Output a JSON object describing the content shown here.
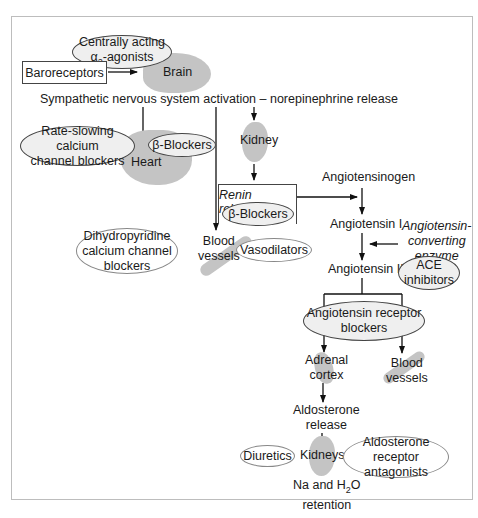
{
  "diagram": {
    "top": {
      "centrally_acting": "Centrally acting",
      "alpha2_prefix": "α",
      "alpha2_sub": "2",
      "alpha2_suffix": "-agonists",
      "baroreceptors": "Baroreceptors",
      "brain": "Brain",
      "sympathetic": "Sympathetic nervous system activation – norepinephrine release"
    },
    "heart_branch": {
      "rate_slowing_line1": "Rate-slowing calcium",
      "rate_slowing_line2": "channel blockers",
      "beta_blockers": "β-Blockers",
      "heart": "Heart"
    },
    "vessel_branch": {
      "dihydropyridine_line1": "Dihydropyridine",
      "dihydropyridine_line2": "calcium channel",
      "dihydropyridine_line3": "blockers",
      "blood_vessels_line1": "Blood",
      "blood_vessels_line2": "vessels",
      "vasodilators": "Vasodilators"
    },
    "kidney_branch": {
      "kidney": "Kidney",
      "renin_release": "Renin release",
      "beta_blockers": "β-Blockers"
    },
    "raas": {
      "angiotensinogen": "Angiotensinogen",
      "angiotensin_i": "Angiotensin I",
      "ace_line1": "Angiotensin-",
      "ace_line2": "converting",
      "ace_line3": "enzyme",
      "angiotensin_ii": "Angiotensin II",
      "ace_inhibitors_line1": "ACE",
      "ace_inhibitors_line2": "inhibitors",
      "arb_line1": "Angiotensin receptor",
      "arb_line2": "blockers",
      "adrenal_line1": "Adrenal",
      "adrenal_line2": "cortex",
      "blood_vessels_line1": "Blood",
      "blood_vessels_line2": "vessels",
      "aldosterone_line1": "Aldosterone",
      "aldosterone_line2": "release",
      "diuretics": "Diuretics",
      "kidneys": "Kidneys",
      "aldo_antag_line1": "Aldosterone",
      "aldo_antag_line2": "receptor antagonists",
      "retention_prefix": "Na and H",
      "retention_sub": "2",
      "retention_suffix": "O",
      "retention_line2": "retention"
    }
  },
  "colors": {
    "organ_fill": "#c4c4c4",
    "drug_ellipse_fill": "#efefef",
    "frame_border": "#bdbdbd"
  }
}
